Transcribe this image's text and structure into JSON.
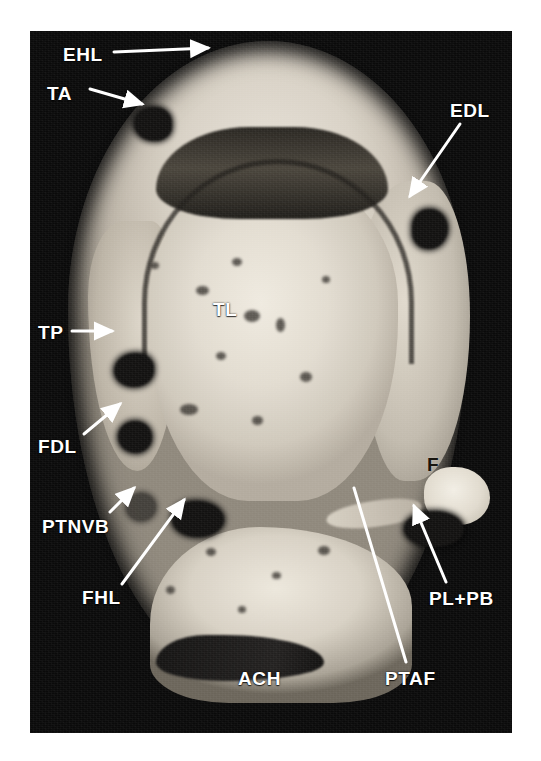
{
  "figure": {
    "kind": "mri-axial-ankle",
    "plate_background": "#0a0a0a",
    "page_background": "#ffffff",
    "label_color": "#ffffff",
    "label_color_dark": "#17150f"
  },
  "annotations": [
    {
      "id": "ehl",
      "text": "EHL",
      "x": 63,
      "y": 45,
      "style": "light",
      "pointer": "arrow-right"
    },
    {
      "id": "ta",
      "text": "TA",
      "x": 47,
      "y": 84,
      "style": "light",
      "pointer": "arrow-down-right"
    },
    {
      "id": "edl",
      "text": "EDL",
      "x": 450,
      "y": 101,
      "style": "light",
      "pointer": "arrow-down-left"
    },
    {
      "id": "tl",
      "text": "TL",
      "x": 213,
      "y": 300,
      "style": "light",
      "pointer": "none"
    },
    {
      "id": "tp",
      "text": "TP",
      "x": 38,
      "y": 323,
      "style": "light",
      "pointer": "arrow-right"
    },
    {
      "id": "fdl",
      "text": "FDL",
      "x": 38,
      "y": 437,
      "style": "light",
      "pointer": "arrow-up-right"
    },
    {
      "id": "ptnvb",
      "text": "PTNVB",
      "x": 42,
      "y": 517,
      "style": "light",
      "pointer": "arrow-up-right"
    },
    {
      "id": "fhl",
      "text": "FHL",
      "x": 82,
      "y": 588,
      "style": "light",
      "pointer": "arrow-up-right"
    },
    {
      "id": "f",
      "text": "F",
      "x": 427,
      "y": 455,
      "style": "dark",
      "pointer": "none"
    },
    {
      "id": "plpb",
      "text": "PL+PB",
      "x": 429,
      "y": 589,
      "style": "light",
      "pointer": "arrow-up-left"
    },
    {
      "id": "ptaf",
      "text": "PTAF",
      "x": 385,
      "y": 669,
      "style": "light",
      "pointer": "line-up"
    },
    {
      "id": "ach",
      "text": "ACH",
      "x": 238,
      "y": 669,
      "style": "light",
      "pointer": "none"
    }
  ],
  "leaders": [
    {
      "id": "leader-ehl",
      "x1": 114,
      "y1": 52,
      "x2": 208,
      "y2": 48,
      "head": true
    },
    {
      "id": "leader-ta",
      "x1": 90,
      "y1": 89,
      "x2": 142,
      "y2": 104,
      "head": true
    },
    {
      "id": "leader-edl",
      "x1": 460,
      "y1": 124,
      "x2": 410,
      "y2": 196,
      "head": true
    },
    {
      "id": "leader-tp",
      "x1": 72,
      "y1": 331,
      "x2": 112,
      "y2": 331,
      "head": true
    },
    {
      "id": "leader-fdl",
      "x1": 84,
      "y1": 434,
      "x2": 120,
      "y2": 404,
      "head": true
    },
    {
      "id": "leader-ptnvb",
      "x1": 110,
      "y1": 512,
      "x2": 134,
      "y2": 488,
      "head": true
    },
    {
      "id": "leader-fhl",
      "x1": 122,
      "y1": 584,
      "x2": 184,
      "y2": 500,
      "head": true
    },
    {
      "id": "leader-plpb",
      "x1": 446,
      "y1": 582,
      "x2": 414,
      "y2": 506,
      "head": true
    },
    {
      "id": "leader-ptaf",
      "x1": 406,
      "y1": 662,
      "x2": 354,
      "y2": 488,
      "head": false
    }
  ],
  "speckles": [
    {
      "x": 196,
      "y": 286,
      "w": 13,
      "h": 9
    },
    {
      "x": 232,
      "y": 258,
      "w": 10,
      "h": 8
    },
    {
      "x": 244,
      "y": 310,
      "w": 16,
      "h": 12
    },
    {
      "x": 216,
      "y": 352,
      "w": 10,
      "h": 8
    },
    {
      "x": 276,
      "y": 318,
      "w": 9,
      "h": 14
    },
    {
      "x": 180,
      "y": 404,
      "w": 18,
      "h": 11
    },
    {
      "x": 252,
      "y": 416,
      "w": 11,
      "h": 9
    },
    {
      "x": 300,
      "y": 372,
      "w": 12,
      "h": 10
    },
    {
      "x": 150,
      "y": 262,
      "w": 9,
      "h": 7
    },
    {
      "x": 322,
      "y": 276,
      "w": 8,
      "h": 7
    },
    {
      "x": 206,
      "y": 548,
      "w": 10,
      "h": 8
    },
    {
      "x": 272,
      "y": 572,
      "w": 9,
      "h": 7
    },
    {
      "x": 318,
      "y": 546,
      "w": 12,
      "h": 9
    },
    {
      "x": 166,
      "y": 586,
      "w": 9,
      "h": 8
    },
    {
      "x": 238,
      "y": 606,
      "w": 8,
      "h": 7
    }
  ]
}
